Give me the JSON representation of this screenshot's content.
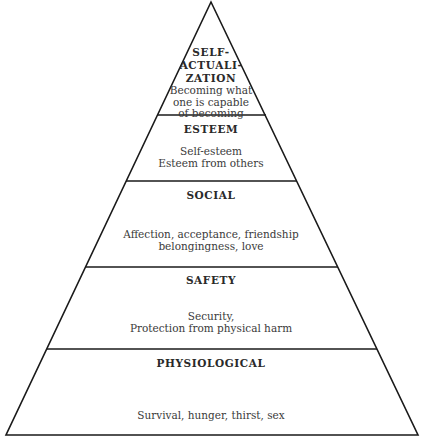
{
  "diagram": {
    "type": "pyramid",
    "levels": [
      {
        "title": "SELF-",
        "title2": "ACTUALI-",
        "title3": "ZATION",
        "desc1": "Becoming what",
        "desc2": "one is capable",
        "desc3": "of becoming"
      },
      {
        "title": "ESTEEM",
        "desc1": "Self-esteem",
        "desc2": "Esteem from others"
      },
      {
        "title": "SOCIAL",
        "desc1": "Affection, acceptance, friendship",
        "desc2": "belongingness, love"
      },
      {
        "title": "SAFETY",
        "desc1": "Security,",
        "desc2": "Protection from physical harm"
      },
      {
        "title": "PHYSIOLOGICAL",
        "desc1": "Survival, hunger, thirst, sex"
      }
    ],
    "line_color": "#1a1a1a"
  }
}
